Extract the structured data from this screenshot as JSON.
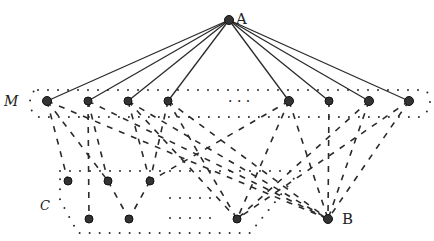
{
  "title": "",
  "labels": {
    "top_node": "A",
    "bottom_node": "B",
    "set_m": "M",
    "set_c": "C"
  },
  "nodes": {
    "A": {
      "x": 229,
      "y": 20
    },
    "B": {
      "x": 328,
      "y": 219
    },
    "M": [
      {
        "x": 47,
        "y": 101
      },
      {
        "x": 88,
        "y": 101
      },
      {
        "x": 128,
        "y": 101
      },
      {
        "x": 168,
        "y": 101
      },
      {
        "x": 289,
        "y": 101
      },
      {
        "x": 329,
        "y": 101
      },
      {
        "x": 369,
        "y": 101
      },
      {
        "x": 409,
        "y": 101
      }
    ],
    "C_upper": [
      {
        "x": 68,
        "y": 181
      },
      {
        "x": 108,
        "y": 181
      },
      {
        "x": 150,
        "y": 181
      }
    ],
    "C_lower": [
      {
        "x": 89,
        "y": 219
      },
      {
        "x": 129,
        "y": 219
      },
      {
        "x": 237,
        "y": 219
      }
    ]
  },
  "ellipsis": "· · ·",
  "colors": {
    "ink": "#2a2a2a",
    "background": "#ffffff"
  }
}
